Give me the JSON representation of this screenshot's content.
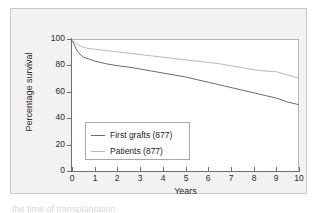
{
  "figure": {
    "background_color": "#f2f2f2",
    "plot_background_color": "#ffffff",
    "caption_fragment": "the time of transplantation"
  },
  "axes": {
    "ylabel": "Percentage survival",
    "xlabel": "Years",
    "y_ticks": [
      "0",
      "20",
      "40",
      "60",
      "80",
      "100"
    ],
    "x_ticks": [
      "0",
      "1",
      "2",
      "3",
      "4",
      "5",
      "6",
      "7",
      "8",
      "9",
      "10"
    ]
  },
  "legend": {
    "items": [
      {
        "label": "First grafts (877)",
        "color": "#6b6b6b"
      },
      {
        "label": "Patients (877)",
        "color": "#b9b9b9"
      }
    ]
  },
  "chart_data": {
    "type": "line",
    "title": "",
    "xlabel": "Years",
    "ylabel": "Percentage survival",
    "xlim": [
      0,
      10
    ],
    "ylim": [
      0,
      100
    ],
    "grid": false,
    "legend_position": "inside-lower-left",
    "x": [
      0,
      0.25,
      0.5,
      0.75,
      1,
      1.5,
      2,
      2.5,
      3,
      3.5,
      4,
      4.5,
      5,
      5.5,
      6,
      6.5,
      7,
      7.5,
      8,
      8.5,
      9,
      9.5,
      10
    ],
    "series": [
      {
        "name": "First grafts (877)",
        "color": "#6b6b6b",
        "values": [
          100,
          91,
          87,
          85.5,
          84,
          82,
          80.5,
          79.5,
          78,
          76.5,
          75,
          73.5,
          72,
          70,
          68,
          66,
          64,
          62,
          60,
          58,
          56,
          53,
          51
        ]
      },
      {
        "name": "Patients (877)",
        "color": "#b9b9b9",
        "values": [
          100,
          96.5,
          94.5,
          93.5,
          93,
          92,
          91,
          90,
          89,
          88,
          87,
          86,
          85,
          84,
          83,
          82,
          80.5,
          79,
          77.5,
          76.5,
          76,
          73.5,
          71
        ]
      }
    ]
  }
}
